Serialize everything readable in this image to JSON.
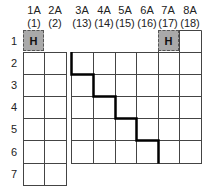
{
  "groups": [
    {
      "name": "1A",
      "number": "(1)"
    },
    {
      "name": "2A",
      "number": "(2)"
    },
    {
      "name": "3A",
      "number": "(13)"
    },
    {
      "name": "4A",
      "number": "(14)"
    },
    {
      "name": "5A",
      "number": "(15)"
    },
    {
      "name": "6A",
      "number": "(16)"
    },
    {
      "name": "7A",
      "number": "(17)"
    },
    {
      "name": "8A",
      "number": "(18)"
    }
  ],
  "periods": [
    "1",
    "2",
    "3",
    "4",
    "5",
    "6",
    "7"
  ],
  "hydrogen_cells": [
    {
      "symbol": "H",
      "group": "1A",
      "period": "1"
    },
    {
      "symbol": "H",
      "group": "7A",
      "period": "1"
    }
  ],
  "colors": {
    "hydrogen_fill": "#a9a9a9",
    "grid_line": "#444444",
    "staircase": "#000000"
  }
}
